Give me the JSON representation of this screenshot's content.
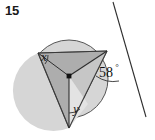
{
  "problem": {
    "number": "15",
    "type": "circle-geometry-diagram"
  },
  "labels": {
    "angle_x": "x",
    "angle_y": "y",
    "angle_known": "58",
    "degree_symbol": "°"
  },
  "colors": {
    "circle_fill": "#d6d6d6",
    "inner_triangle_fill": "#adadad",
    "outline": "#4d4d4d",
    "line": "#333333",
    "center_dot": "#111111",
    "page_background": "#ffffff",
    "number_color": "#1a1a1a"
  },
  "geometry": {
    "circle": {
      "cx": 69,
      "cy": 79,
      "r": 39
    },
    "points": {
      "center": {
        "x": 69,
        "y": 76
      },
      "left_vertex": {
        "x": 38,
        "y": 53
      },
      "tangent_point": {
        "x": 107,
        "y": 51
      },
      "bottom_vertex": {
        "x": 69,
        "y": 128
      }
    },
    "tangent_line": {
      "start": {
        "x": 113,
        "y": 2
      },
      "end": {
        "x": 146,
        "y": 117
      }
    }
  }
}
